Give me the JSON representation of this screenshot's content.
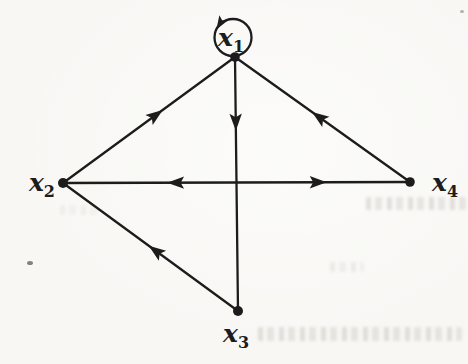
{
  "figure": {
    "kind": "directed-graph-signal-flow",
    "background_color": "#f8f7f4",
    "ink_color": "#1c1c1c",
    "width": 468,
    "height": 364
  },
  "graph": {
    "nodes": [
      {
        "id": "x1",
        "label_base": "x",
        "label_sub": "1",
        "x": 235,
        "y": 57,
        "dot_r": 4.8,
        "label_x": 231,
        "label_y": 46,
        "anchor": "middle",
        "loop": {
          "cx": 233,
          "cy": 37.5,
          "r": 18.5,
          "arrow_angle_deg": 206,
          "arrow_rot_deg": 122
        }
      },
      {
        "id": "x2",
        "label_base": "x",
        "label_sub": "2",
        "x": 63,
        "y": 183,
        "dot_r": 5,
        "label_x": 55,
        "label_y": 191,
        "anchor": "end"
      },
      {
        "id": "x3",
        "label_base": "x",
        "label_sub": "3",
        "x": 238,
        "y": 311,
        "dot_r": 5,
        "label_x": 236,
        "label_y": 342,
        "anchor": "middle"
      },
      {
        "id": "x4",
        "label_base": "x",
        "label_sub": "4",
        "x": 410,
        "y": 182,
        "dot_r": 4.8,
        "label_x": 432,
        "label_y": 191,
        "anchor": "start"
      }
    ],
    "edges": [
      {
        "from": "x2",
        "to": "x1",
        "arrows": [
          {
            "t": 0.58,
            "dir": "forward"
          }
        ]
      },
      {
        "from": "x4",
        "to": "x1",
        "arrows": [
          {
            "t": 0.56,
            "dir": "forward"
          }
        ]
      },
      {
        "from": "x1",
        "to": "x3",
        "arrows": [
          {
            "t": 0.29,
            "dir": "forward"
          }
        ]
      },
      {
        "from": "x2",
        "to": "x4",
        "arrows": [
          {
            "t": 0.3,
            "dir": "backward"
          },
          {
            "t": 0.76,
            "dir": "forward"
          }
        ]
      },
      {
        "from": "x3",
        "to": "x2",
        "arrows": [
          {
            "t": 0.51,
            "dir": "forward"
          }
        ]
      }
    ],
    "style": {
      "line_width": 2.3,
      "arrow_length": 17,
      "arrow_half_width": 6.2,
      "arrow_notch": 13.5,
      "label_font_size": 25,
      "label_sub_font_size": 16,
      "label_sub_dy": 6
    }
  }
}
